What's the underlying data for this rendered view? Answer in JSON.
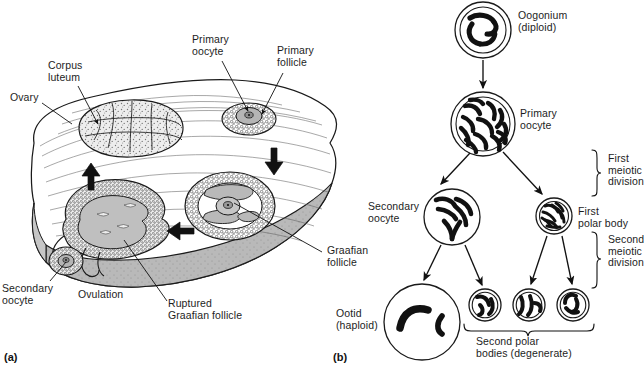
{
  "figure": {
    "panels": [
      {
        "id": "a",
        "caption": "(a)",
        "subject": "Ovary cross-section showing follicular development and ovulation"
      },
      {
        "id": "b",
        "caption": "(b)",
        "subject": "Oogenesis meiotic lineage diagram"
      }
    ],
    "line_color": "#1a1a1a",
    "stroke_color": "#222222",
    "cortex_fill": "#ffffff",
    "medulla_fill": "#b9b9b9",
    "cell_fill": "#c2c2c2",
    "granulosa_fill": "#e4e4e4",
    "chromosome_color": "#111111"
  },
  "panel_a": {
    "caption": "(a)",
    "labels": [
      {
        "name": "ovary",
        "text": "Ovary",
        "x": 10,
        "y": 92,
        "align": "left"
      },
      {
        "name": "corpus-luteum",
        "text": "Corpus\nluteum",
        "x": 48,
        "y": 60,
        "align": "left"
      },
      {
        "name": "primary-oocyte",
        "text": "Primary\noocyte",
        "x": 192,
        "y": 34,
        "align": "left"
      },
      {
        "name": "primary-follicle",
        "text": "Primary\nfollicle",
        "x": 277,
        "y": 45,
        "align": "left"
      },
      {
        "name": "graafian-follicle",
        "text": "Graafian\nfollicle",
        "x": 327,
        "y": 245,
        "align": "left"
      },
      {
        "name": "secondary-oocyte",
        "text": "Secondary\noocyte",
        "x": 2,
        "y": 283,
        "align": "left"
      },
      {
        "name": "ovulation",
        "text": "Ovulation",
        "x": 78,
        "y": 289,
        "align": "left"
      },
      {
        "name": "ruptured-graafian-follicle",
        "text": "Ruptured\nGraafian follicle",
        "x": 168,
        "y": 298,
        "align": "left"
      }
    ],
    "leader_lines": [
      {
        "name": "leader-ovary",
        "x1": 42,
        "y1": 102,
        "x2": 70,
        "y2": 122
      },
      {
        "name": "leader-corpus-luteum",
        "x1": 80,
        "y1": 85,
        "x2": 96,
        "y2": 123
      },
      {
        "name": "leader-primary-oocyte",
        "x1": 222,
        "y1": 60,
        "x2": 247,
        "y2": 110
      },
      {
        "name": "leader-primary-follicle",
        "x1": 282,
        "y1": 72,
        "x2": 258,
        "y2": 118
      },
      {
        "name": "leader-graafian-follicle",
        "x1": 322,
        "y1": 252,
        "x2": 232,
        "y2": 202
      },
      {
        "name": "leader-secondary-oocyte",
        "x1": 48,
        "y1": 282,
        "x2": 68,
        "y2": 261
      },
      {
        "name": "leader-ruptured-graafian-follicle",
        "x1": 167,
        "y1": 301,
        "x2": 124,
        "y2": 243
      }
    ],
    "structures": [
      {
        "name": "corpus-luteum-body",
        "cx": 130,
        "cy": 127,
        "rx": 53,
        "ry": 28
      },
      {
        "name": "primary-follicle-body",
        "cx": 249,
        "cy": 118,
        "rx": 26,
        "ry": 15
      },
      {
        "name": "graafian-follicle-body",
        "cx": 230,
        "cy": 205,
        "rx": 44,
        "ry": 33
      },
      {
        "name": "ruptured-follicle-body",
        "cx": 118,
        "cy": 225,
        "rx": 55,
        "ry": 37
      },
      {
        "name": "ovulated-secondary-oocyte",
        "cx": 68,
        "cy": 262,
        "rx": 17,
        "ry": 13
      }
    ],
    "cycle_arrows": [
      {
        "name": "cycle-arrow-left",
        "x": 88,
        "y": 175,
        "dir": "up"
      },
      {
        "name": "cycle-arrow-right",
        "x": 272,
        "y": 160,
        "dir": "down"
      },
      {
        "name": "cycle-arrow-bottom",
        "x": 178,
        "y": 232,
        "dir": "left"
      }
    ]
  },
  "panel_b": {
    "caption": "(b)",
    "cells": [
      {
        "name": "cell-oogonium",
        "label": "Oogonium\n(diploid)",
        "label_x": 518,
        "label_y": 10,
        "cx": 483,
        "cy": 30,
        "r": 28,
        "double_wall": true,
        "chromosomes": 4
      },
      {
        "name": "cell-primary-oocyte",
        "label": "Primary\noocyte",
        "label_x": 520,
        "label_y": 108,
        "cx": 483,
        "cy": 124,
        "r": 32,
        "double_wall": true,
        "chromosomes": 12
      },
      {
        "name": "cell-secondary-oocyte",
        "label": "Secondary\noocyte",
        "label_x": 368,
        "label_y": 201,
        "cx": 452,
        "cy": 217,
        "r": 28,
        "double_wall": false,
        "chromosomes": 6
      },
      {
        "name": "cell-first-polar-body",
        "label": "First\npolar body",
        "label_x": 578,
        "label_y": 206,
        "cx": 554,
        "cy": 216,
        "r": 18,
        "double_wall": true,
        "chromosomes": 8
      },
      {
        "name": "cell-ootid",
        "label": "Ootid\n(haploid)",
        "label_x": 336,
        "label_y": 308,
        "cx": 422,
        "cy": 322,
        "r": 38,
        "double_wall": false,
        "chromosomes": 2
      },
      {
        "name": "cell-second-polar-body-1",
        "label": "",
        "label_x": 0,
        "label_y": 0,
        "cx": 485,
        "cy": 305,
        "r": 16,
        "double_wall": true,
        "chromosomes": 3
      },
      {
        "name": "cell-second-polar-body-2",
        "label": "",
        "label_x": 0,
        "label_y": 0,
        "cx": 529,
        "cy": 305,
        "r": 16,
        "double_wall": true,
        "chromosomes": 3
      },
      {
        "name": "cell-second-polar-body-3",
        "label": "",
        "label_x": 0,
        "label_y": 0,
        "cx": 573,
        "cy": 305,
        "r": 16,
        "double_wall": true,
        "chromosomes": 3
      }
    ],
    "arrows": [
      {
        "name": "arrow-oogonium-to-primary",
        "x1": 483,
        "y1": 60,
        "x2": 483,
        "y2": 88
      },
      {
        "name": "arrow-primary-to-secondary",
        "x1": 469,
        "y1": 153,
        "x2": 440,
        "y2": 186
      },
      {
        "name": "arrow-primary-to-first-polar",
        "x1": 503,
        "y1": 152,
        "x2": 543,
        "y2": 196
      },
      {
        "name": "arrow-secondary-to-ootid",
        "x1": 441,
        "y1": 246,
        "x2": 423,
        "y2": 280
      },
      {
        "name": "arrow-secondary-to-polar-1",
        "x1": 466,
        "y1": 246,
        "x2": 483,
        "y2": 286
      },
      {
        "name": "arrow-first-polar-to-polar-2",
        "x1": 547,
        "y1": 236,
        "x2": 530,
        "y2": 285
      },
      {
        "name": "arrow-first-polar-to-polar-3",
        "x1": 562,
        "y1": 236,
        "x2": 573,
        "y2": 285
      }
    ],
    "brackets": [
      {
        "name": "bracket-first-meiotic-division",
        "x": 598,
        "y1": 150,
        "y2": 196,
        "label": "First\nmeiotic\ndivision",
        "label_x": 608,
        "label_y": 154
      },
      {
        "name": "bracket-second-meiotic-division",
        "x": 598,
        "y1": 232,
        "y2": 288,
        "label": "Second\nmeiotic\ndivision",
        "label_x": 608,
        "label_y": 234
      },
      {
        "name": "bracket-second-polar-bodies",
        "x_horizontal": true,
        "x1": 464,
        "x2": 594,
        "y": 330,
        "label": "Second polar\nbodies (degenerate)",
        "label_x": 478,
        "label_y": 336
      }
    ]
  }
}
